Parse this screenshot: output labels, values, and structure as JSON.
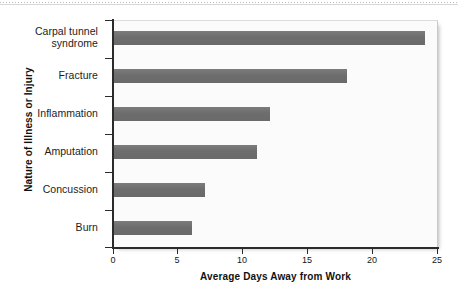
{
  "chart_data": {
    "type": "bar",
    "orientation": "horizontal",
    "title": "",
    "xlabel": "Average Days Away from Work",
    "ylabel": "Nature of Illness or Injury",
    "categories": [
      "Carpal tunnel syndrome",
      "Fracture",
      "Inflammation",
      "Amputation",
      "Concussion",
      "Burn"
    ],
    "values": [
      24,
      18,
      12,
      11,
      7,
      6
    ],
    "xlim": [
      0,
      25
    ],
    "xticks": [
      0,
      5,
      10,
      15,
      20,
      25
    ],
    "xtick_labels": [
      "0",
      "5",
      "10",
      "15",
      "20",
      "25"
    ],
    "grid": false,
    "legend": false,
    "bar_color": "#707070",
    "plot_background": "#fbfbfb",
    "axis_color": "#2b2b2b"
  },
  "labels": {
    "carpal_line1": "Carpal tunnel",
    "carpal_line2": "syndrome"
  }
}
